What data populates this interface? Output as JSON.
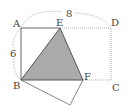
{
  "diagram": {
    "points": {
      "A": {
        "label": "A",
        "x": 21,
        "y": 28
      },
      "E": {
        "label": "E",
        "x": 60,
        "y": 28
      },
      "D": {
        "label": "D",
        "x": 111,
        "y": 28
      },
      "B": {
        "label": "B",
        "x": 21,
        "y": 80
      },
      "F": {
        "label": "F",
        "x": 83,
        "y": 80
      },
      "C": {
        "label": "C",
        "x": 111,
        "y": 80
      },
      "G": {
        "label": "",
        "x": 70,
        "y": 105
      }
    },
    "dimensions": {
      "width_label": "8",
      "height_label": "6"
    },
    "colors": {
      "line": "#666666",
      "dotted": "#999999",
      "fill": "#aaaaaa",
      "arc": "#bbbbbb"
    }
  }
}
